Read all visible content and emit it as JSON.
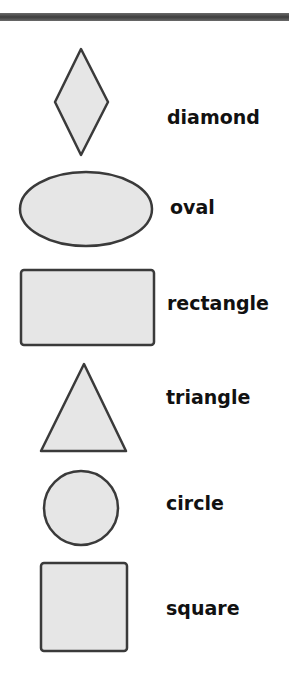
{
  "colors": {
    "fill": "#e6e6e6",
    "stroke": "#3a3a3a",
    "bar": "#4a4a4a"
  },
  "shapes": [
    {
      "name": "diamond",
      "label": "diamond"
    },
    {
      "name": "oval",
      "label": "oval"
    },
    {
      "name": "rectangle",
      "label": "rectangle"
    },
    {
      "name": "triangle",
      "label": "triangle"
    },
    {
      "name": "circle",
      "label": "circle"
    },
    {
      "name": "square",
      "label": "square"
    }
  ]
}
